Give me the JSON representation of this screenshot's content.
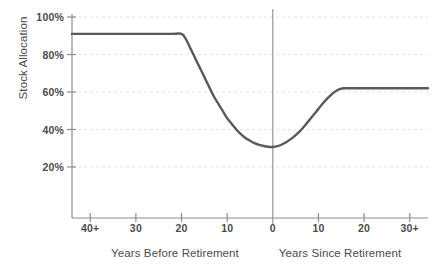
{
  "chart_data": {
    "type": "line",
    "title": "",
    "subtitle": "",
    "ylabel": "Stock Allocation",
    "xlabel_left": "Years Before Retirement",
    "xlabel_right": "Years Since Retirement",
    "grid": true,
    "legend": "none",
    "ylim": [
      0,
      100
    ],
    "yticks": [
      {
        "value": 100,
        "label": "100%"
      },
      {
        "value": 80,
        "label": "80%"
      },
      {
        "value": 60,
        "label": "60%"
      },
      {
        "value": 40,
        "label": "40%"
      },
      {
        "value": 20,
        "label": "20%"
      }
    ],
    "xticks": [
      {
        "x": -40,
        "label": "40+"
      },
      {
        "x": -30,
        "label": "30"
      },
      {
        "x": -20,
        "label": "20"
      },
      {
        "x": -10,
        "label": "10"
      },
      {
        "x": 0,
        "label": "0"
      },
      {
        "x": 10,
        "label": "10"
      },
      {
        "x": 20,
        "label": "20"
      },
      {
        "x": 30,
        "label": "30+"
      }
    ],
    "xlim": [
      -44,
      34
    ],
    "reference_line_x": 0,
    "series": [
      {
        "name": "Stock Allocation Glidepath",
        "color": "#5a5a5a",
        "points": [
          {
            "x": -44,
            "y": 91
          },
          {
            "x": -40,
            "y": 91
          },
          {
            "x": -30,
            "y": 91
          },
          {
            "x": -22,
            "y": 91
          },
          {
            "x": -20,
            "y": 91
          },
          {
            "x": -19,
            "y": 88
          },
          {
            "x": -18,
            "y": 83
          },
          {
            "x": -17,
            "y": 78
          },
          {
            "x": -16,
            "y": 73
          },
          {
            "x": -15,
            "y": 68
          },
          {
            "x": -14,
            "y": 63
          },
          {
            "x": -13,
            "y": 58
          },
          {
            "x": -12,
            "y": 54
          },
          {
            "x": -11,
            "y": 50
          },
          {
            "x": -10,
            "y": 46
          },
          {
            "x": -9,
            "y": 43
          },
          {
            "x": -8,
            "y": 40
          },
          {
            "x": -7,
            "y": 37.5
          },
          {
            "x": -6,
            "y": 35.5
          },
          {
            "x": -5,
            "y": 34
          },
          {
            "x": -4,
            "y": 32.7
          },
          {
            "x": -3,
            "y": 31.8
          },
          {
            "x": -2,
            "y": 31.2
          },
          {
            "x": -1,
            "y": 30.8
          },
          {
            "x": 0,
            "y": 30.7
          },
          {
            "x": 1,
            "y": 31.1
          },
          {
            "x": 2,
            "y": 32
          },
          {
            "x": 3,
            "y": 33.3
          },
          {
            "x": 4,
            "y": 35
          },
          {
            "x": 5,
            "y": 37
          },
          {
            "x": 6,
            "y": 39.3
          },
          {
            "x": 7,
            "y": 42
          },
          {
            "x": 8,
            "y": 45
          },
          {
            "x": 9,
            "y": 48
          },
          {
            "x": 10,
            "y": 51
          },
          {
            "x": 11,
            "y": 54
          },
          {
            "x": 12,
            "y": 56.7
          },
          {
            "x": 13,
            "y": 59
          },
          {
            "x": 14,
            "y": 60.8
          },
          {
            "x": 15,
            "y": 61.8
          },
          {
            "x": 16,
            "y": 62
          },
          {
            "x": 20,
            "y": 62
          },
          {
            "x": 30,
            "y": 62
          },
          {
            "x": 34,
            "y": 62
          }
        ]
      }
    ],
    "annotations": [],
    "key_values": {
      "pre_retirement_plateau_pct": 91,
      "glidepath_start_years_before": 20,
      "retirement_minimum_pct": 31,
      "post_retirement_plateau_pct": 62,
      "plateau_reached_years_after": 16
    }
  },
  "style": {
    "line_color": "#5a5a5a",
    "axis_color": "#8c8c8c",
    "grid_color": "#e2e2e2",
    "text_color": "#4b4b4b",
    "background": "#ffffff"
  }
}
